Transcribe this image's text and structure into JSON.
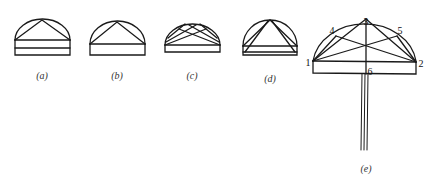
{
  "figure": {
    "panels": [
      {
        "id": "a",
        "label": "(a)",
        "description": "Hemisphere dome with single apex triangle and double-banded base"
      },
      {
        "id": "b",
        "label": "(b)",
        "description": "Hemisphere dome with single apex triangle and plain base"
      },
      {
        "id": "c",
        "label": "(c)",
        "description": "Hemisphere dome with crossed diagonal struts"
      },
      {
        "id": "d",
        "label": "(d)",
        "description": "Hemisphere dome with nested triangles and banded base"
      },
      {
        "id": "e",
        "label": "(e)",
        "description": "Labeled dome with crossed struts on a post"
      }
    ],
    "points_e": [
      {
        "label": "1",
        "x": 308,
        "y": 61
      },
      {
        "label": "2",
        "x": 421,
        "y": 63
      },
      {
        "label": "3",
        "x": 366,
        "y": 21
      },
      {
        "label": "4",
        "x": 332,
        "y": 30
      },
      {
        "label": "5",
        "x": 399,
        "y": 30
      },
      {
        "label": "6",
        "x": 369,
        "y": 72
      }
    ],
    "stroke_color": "#1a1a1a"
  }
}
